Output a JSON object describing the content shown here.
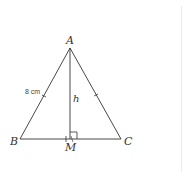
{
  "figure": {
    "type": "isosceles-triangle",
    "vertices": {
      "A": {
        "label": "A",
        "x": 70,
        "y": 48
      },
      "B": {
        "label": "B",
        "x": 20,
        "y": 139
      },
      "C": {
        "label": "C",
        "x": 121,
        "y": 139
      },
      "M": {
        "label": "M",
        "x": 70,
        "y": 139
      }
    },
    "labels": {
      "A": "A",
      "B": "B",
      "C": "C",
      "M": "M",
      "height": "h",
      "side_ab": "8 cm"
    },
    "stroke_color": "#333333"
  }
}
